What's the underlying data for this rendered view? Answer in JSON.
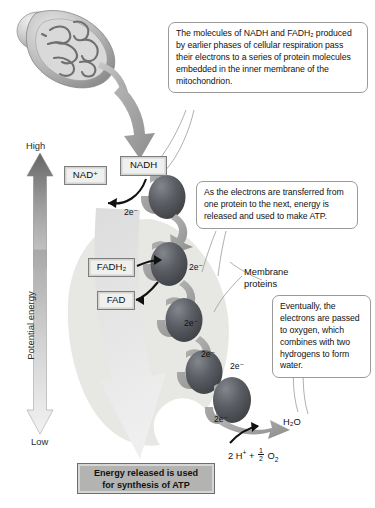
{
  "figure": {
    "axis_label": "Potential energy",
    "axis_high": "High",
    "axis_low": "Low"
  },
  "callouts": [
    {
      "id": "callout-1",
      "text": "The molecules of NADH and FADH₂ produced by earlier phases of cellular respiration pass their electrons to a series of protein molecules embedded in the inner membrane of the mitochondrion."
    },
    {
      "id": "callout-2",
      "text": "As the electrons are transferred from one protein to the next, energy is released and used to make ATP."
    },
    {
      "id": "callout-3",
      "text": "Eventually, the electrons are passed to oxygen, which combines with two hydrogens to form water."
    }
  ],
  "molecule_boxes": [
    {
      "id": "nad-plus",
      "label": "NAD⁺"
    },
    {
      "id": "nadh",
      "label": "NADH"
    },
    {
      "id": "fadh2",
      "label": "FADH₂"
    },
    {
      "id": "fad",
      "label": "FAD"
    }
  ],
  "labels": {
    "membrane_proteins": "Membrane proteins",
    "membrane_proteins_line1": "Membrane",
    "membrane_proteins_line2": "proteins",
    "water": "H₂O",
    "equation": "2 H⁺ + ½ O₂",
    "equation_parts": {
      "protons": "2 H",
      "plus": "+",
      "half": "1/2",
      "oxygen": "O"
    }
  },
  "electron_labels": [
    {
      "id": "e-nadh",
      "text": "2e⁻"
    },
    {
      "id": "e-p1-p2",
      "text": "2e⁻"
    },
    {
      "id": "e-p2-p3",
      "text": "2e⁻"
    },
    {
      "id": "e-p3-p4",
      "text": "2e⁻"
    },
    {
      "id": "e-p4-p5",
      "text": "2e⁻"
    },
    {
      "id": "e-oxygen",
      "text": "2e⁻"
    }
  ],
  "banner": {
    "line1": "Energy released is used",
    "line2": "for synthesis of ATP"
  },
  "icons": {
    "mitochondrion": "mitochondrion-icon",
    "energy_up_arrow": "up-arrow-icon",
    "energy_down_arrow": "down-arrow-icon",
    "descent_arrow": "large-descending-arrow-icon",
    "protein_complex": "protein-oval-icon"
  },
  "colors": {
    "protein_dark": "#4a4a4f",
    "protein_light": "#777a7f",
    "arrow_gray": "#9a9a9a",
    "membrane_blob": "#e6e6e3",
    "banner_fill": "#b3b3b1",
    "box_fill": "#f0f0ee",
    "callout_border": "#9a9a9a",
    "text": "#111111"
  }
}
